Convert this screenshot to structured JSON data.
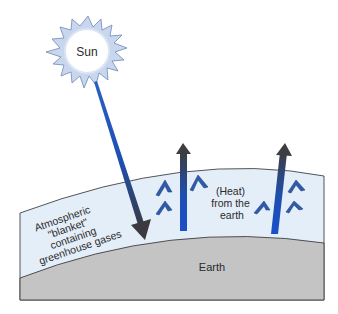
{
  "diagram": {
    "labels": {
      "sun": "Sun",
      "atmosphere": [
        "Atmospheric",
        "\"blanket\"",
        "containing",
        "greenhouse gases"
      ],
      "heat": [
        "(Heat)",
        "from the",
        "earth"
      ],
      "earth": "Earth"
    },
    "colors": {
      "sun_fill": "#c8d7ee",
      "sun_core": "#ffffff",
      "sun_stroke": "#6f88b8",
      "atmosphere_fill": "#e4eef8",
      "earth_fill": "#c4c4c4",
      "ray_blue": "#1d4fb0",
      "ray_dark": "#3a3a3f",
      "wave_blue": "#2f5aa8"
    }
  }
}
